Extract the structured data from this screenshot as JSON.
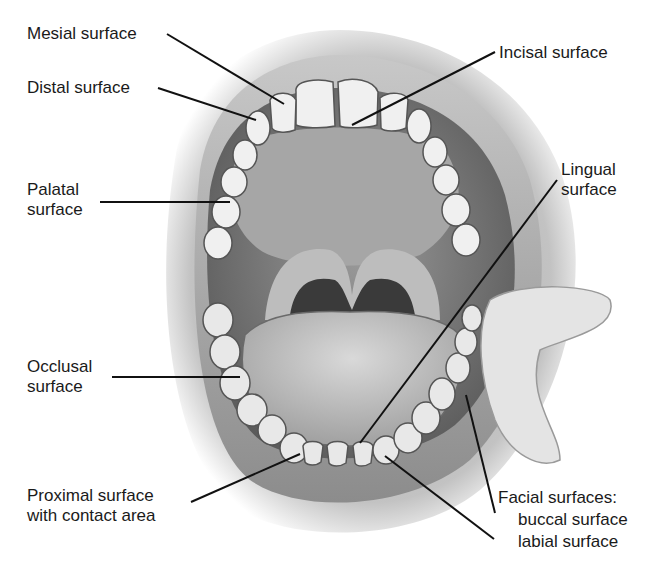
{
  "figure": {
    "style": "grayscale pencil illustration",
    "colors": {
      "background": "#ffffff",
      "text": "#1a1a1a",
      "leader_line": "#111111",
      "tissue_dark": "#4a4a4a",
      "tissue_mid": "#8a8a8a",
      "tooth": "#f2f2f2"
    }
  },
  "labels": {
    "mesial": {
      "text": "Mesial surface"
    },
    "distal": {
      "text": "Distal surface"
    },
    "incisal": {
      "text": "Incisal surface"
    },
    "palatal": {
      "line1": "Palatal",
      "line2": "surface"
    },
    "lingual": {
      "line1": "Lingual",
      "line2": "surface"
    },
    "occlusal": {
      "line1": "Occlusal",
      "line2": "surface"
    },
    "proximal": {
      "line1": "Proximal surface",
      "line2": "with contact area"
    },
    "facial": {
      "line1": "Facial surfaces:",
      "line2": "buccal surface",
      "line3": "labial surface"
    }
  }
}
